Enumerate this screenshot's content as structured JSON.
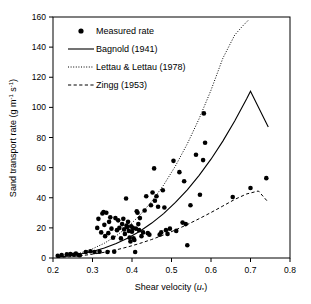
{
  "chart_data": {
    "type": "scatter",
    "title": "",
    "xlabel": "Shear velocity (u*)",
    "xlabel_main": "Shear velocity (",
    "xlabel_var": "u",
    "xlabel_sub": "*",
    "xlabel_end": ")",
    "ylabel": "Sand transport rate (g m-1 s-1)",
    "ylabel_parts": {
      "a": "Sand transport rate (g m",
      "exp1": "-1",
      "b": " s",
      "exp2": "-1",
      "c": ")"
    },
    "xlim": [
      0.2,
      0.8
    ],
    "ylim": [
      0,
      160
    ],
    "xticks": [
      0.2,
      0.3,
      0.4,
      0.5,
      0.6,
      0.7,
      0.8
    ],
    "xticklabels": [
      "0.2",
      "0.3",
      "0.4",
      "0.5",
      "0.6",
      "0.7",
      "0.8"
    ],
    "yticks": [
      0,
      20,
      40,
      60,
      80,
      100,
      120,
      140,
      160
    ],
    "yticklabels": [
      "0",
      "20",
      "40",
      "60",
      "80",
      "100",
      "120",
      "140",
      "160"
    ],
    "grid": false,
    "legend_position": "top-left",
    "legend": [
      {
        "label": "Measured rate",
        "marker": "filled-circle",
        "style": "marker"
      },
      {
        "label": "Bagnold (1941)",
        "marker": "line",
        "style": "solid"
      },
      {
        "label": "Lettau & Lettau (1978)",
        "marker": "line",
        "style": "dotted"
      },
      {
        "label": "Zingg (1953)",
        "marker": "line",
        "style": "dashed"
      }
    ],
    "series": [
      {
        "name": "Measured rate",
        "type": "scatter",
        "marker": "filled-circle",
        "color": "#000000",
        "points": [
          [
            0.212,
            1.5
          ],
          [
            0.222,
            2.0
          ],
          [
            0.235,
            2.5
          ],
          [
            0.244,
            2.6
          ],
          [
            0.252,
            2.2
          ],
          [
            0.258,
            3.0
          ],
          [
            0.265,
            2.0
          ],
          [
            0.268,
            1.8
          ],
          [
            0.283,
            4.0
          ],
          [
            0.295,
            4.5
          ],
          [
            0.305,
            4.0
          ],
          [
            0.312,
            20.0
          ],
          [
            0.315,
            26.0
          ],
          [
            0.318,
            4.2
          ],
          [
            0.322,
            17.0
          ],
          [
            0.325,
            29.5
          ],
          [
            0.328,
            30.5
          ],
          [
            0.33,
            22.0
          ],
          [
            0.332,
            14.5
          ],
          [
            0.335,
            30.0
          ],
          [
            0.338,
            4.0
          ],
          [
            0.34,
            16.5
          ],
          [
            0.342,
            24.0
          ],
          [
            0.345,
            27.0
          ],
          [
            0.348,
            19.5
          ],
          [
            0.352,
            13.5
          ],
          [
            0.355,
            4.2
          ],
          [
            0.358,
            26.5
          ],
          [
            0.362,
            18.5
          ],
          [
            0.365,
            25.0
          ],
          [
            0.368,
            20.0
          ],
          [
            0.372,
            13.0
          ],
          [
            0.375,
            22.5
          ],
          [
            0.378,
            26.0
          ],
          [
            0.38,
            19.0
          ],
          [
            0.382,
            16.0
          ],
          [
            0.385,
            39.5
          ],
          [
            0.386,
            21.5
          ],
          [
            0.388,
            20.5
          ],
          [
            0.39,
            24.0
          ],
          [
            0.392,
            18.0
          ],
          [
            0.394,
            13.5
          ],
          [
            0.396,
            11.0
          ],
          [
            0.398,
            21.0
          ],
          [
            0.4,
            17.5
          ],
          [
            0.402,
            20.0
          ],
          [
            0.404,
            13.0
          ],
          [
            0.406,
            12.0
          ],
          [
            0.408,
            4.0
          ],
          [
            0.41,
            19.5
          ],
          [
            0.412,
            31.0
          ],
          [
            0.414,
            30.0
          ],
          [
            0.416,
            22.5
          ],
          [
            0.418,
            18.5
          ],
          [
            0.42,
            26.5
          ],
          [
            0.424,
            14.5
          ],
          [
            0.428,
            17.0
          ],
          [
            0.432,
            31.5
          ],
          [
            0.436,
            41.0
          ],
          [
            0.44,
            16.5
          ],
          [
            0.444,
            15.5
          ],
          [
            0.448,
            35.0
          ],
          [
            0.452,
            43.5
          ],
          [
            0.456,
            59.5
          ],
          [
            0.458,
            38.0
          ],
          [
            0.462,
            41.0
          ],
          [
            0.466,
            34.0
          ],
          [
            0.47,
            15.5
          ],
          [
            0.474,
            17.0
          ],
          [
            0.478,
            45.0
          ],
          [
            0.482,
            33.5
          ],
          [
            0.486,
            18.5
          ],
          [
            0.49,
            16.0
          ],
          [
            0.496,
            19.5
          ],
          [
            0.505,
            64.5
          ],
          [
            0.512,
            18.0
          ],
          [
            0.52,
            57.0
          ],
          [
            0.528,
            23.5
          ],
          [
            0.532,
            51.0
          ],
          [
            0.536,
            22.5
          ],
          [
            0.54,
            8.5
          ],
          [
            0.548,
            35.0
          ],
          [
            0.562,
            68.5
          ],
          [
            0.572,
            42.0
          ],
          [
            0.58,
            65.0
          ],
          [
            0.582,
            96.0
          ],
          [
            0.585,
            76.5
          ],
          [
            0.655,
            40.5
          ],
          [
            0.7,
            46.5
          ],
          [
            0.74,
            53.0
          ]
        ]
      },
      {
        "name": "Bagnold (1941)",
        "type": "line",
        "style": "solid",
        "color": "#000000",
        "points": [
          [
            0.21,
            0.6
          ],
          [
            0.24,
            1.4
          ],
          [
            0.27,
            2.6
          ],
          [
            0.3,
            4.3
          ],
          [
            0.33,
            6.6
          ],
          [
            0.36,
            9.6
          ],
          [
            0.39,
            13.3
          ],
          [
            0.42,
            17.8
          ],
          [
            0.45,
            23.2
          ],
          [
            0.48,
            29.5
          ],
          [
            0.51,
            36.9
          ],
          [
            0.54,
            45.3
          ],
          [
            0.57,
            54.9
          ],
          [
            0.6,
            65.6
          ],
          [
            0.63,
            77.6
          ],
          [
            0.66,
            90.9
          ],
          [
            0.69,
            105.5
          ],
          [
            0.7,
            110.7
          ],
          [
            0.745,
            87.0
          ]
        ]
      },
      {
        "name": "Lettau & Lettau (1978)",
        "type": "line",
        "style": "dotted",
        "color": "#000000",
        "points": [
          [
            0.21,
            0.5
          ],
          [
            0.24,
            1.6
          ],
          [
            0.27,
            3.4
          ],
          [
            0.3,
            6.1
          ],
          [
            0.33,
            9.8
          ],
          [
            0.36,
            14.7
          ],
          [
            0.39,
            20.8
          ],
          [
            0.42,
            28.4
          ],
          [
            0.45,
            37.6
          ],
          [
            0.48,
            48.4
          ],
          [
            0.51,
            61.1
          ],
          [
            0.54,
            75.8
          ],
          [
            0.57,
            92.5
          ],
          [
            0.6,
            111.4
          ],
          [
            0.63,
            132.6
          ],
          [
            0.66,
            148.0
          ],
          [
            0.68,
            154.0
          ],
          [
            0.695,
            158.0
          ]
        ]
      },
      {
        "name": "Zingg (1953)",
        "type": "line",
        "style": "dashed",
        "color": "#000000",
        "points": [
          [
            0.21,
            0.3
          ],
          [
            0.24,
            0.8
          ],
          [
            0.27,
            1.5
          ],
          [
            0.3,
            2.5
          ],
          [
            0.33,
            3.8
          ],
          [
            0.36,
            5.4
          ],
          [
            0.39,
            7.4
          ],
          [
            0.42,
            9.7
          ],
          [
            0.45,
            12.3
          ],
          [
            0.48,
            15.3
          ],
          [
            0.51,
            18.6
          ],
          [
            0.54,
            22.2
          ],
          [
            0.57,
            26.1
          ],
          [
            0.6,
            30.2
          ],
          [
            0.63,
            34.5
          ],
          [
            0.66,
            38.9
          ],
          [
            0.69,
            42.5
          ],
          [
            0.72,
            44.5
          ],
          [
            0.745,
            37.0
          ]
        ]
      }
    ]
  }
}
